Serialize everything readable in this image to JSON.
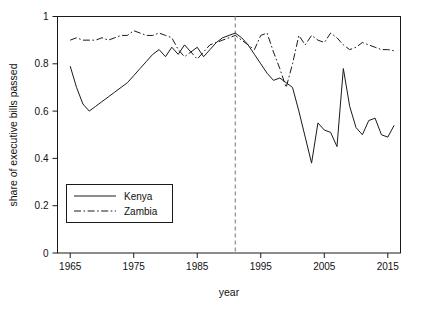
{
  "chart_data": {
    "type": "line",
    "title": "",
    "xlabel": "year",
    "ylabel": "share of executive bills passed",
    "xlim": [
      1963,
      2017
    ],
    "ylim": [
      0,
      1
    ],
    "xticks": [
      1965,
      1975,
      1985,
      1995,
      2005,
      2015
    ],
    "xticklabels": [
      "1965",
      "1975",
      "1985",
      "1995",
      "2005",
      "2015"
    ],
    "yticks": [
      0,
      0.2,
      0.4,
      0.6,
      0.8,
      1
    ],
    "yticklabels": [
      "0",
      "0.2",
      "0.4",
      "0.6",
      "0.8",
      "1"
    ],
    "grid": false,
    "legend_position": "lower-left",
    "annotations": [
      {
        "type": "vline",
        "x": 1991,
        "style": "dashed",
        "color": "#9a9a9a",
        "label": ""
      }
    ],
    "series": [
      {
        "name": "Kenya",
        "style": "solid",
        "color": "#1a1a1a",
        "x": [
          1965,
          1966,
          1967,
          1968,
          1969,
          1970,
          1971,
          1972,
          1973,
          1974,
          1975,
          1976,
          1977,
          1978,
          1979,
          1980,
          1981,
          1982,
          1983,
          1984,
          1985,
          1986,
          1987,
          1988,
          1989,
          1990,
          1991,
          1992,
          1993,
          1994,
          1995,
          1996,
          1997,
          1998,
          1999,
          2000,
          2001,
          2002,
          2003,
          2004,
          2005,
          2006,
          2007,
          2008,
          2009,
          2010,
          2011,
          2012,
          2013,
          2014,
          2015,
          2016
        ],
        "values": [
          0.79,
          0.7,
          0.63,
          0.6,
          0.62,
          0.64,
          0.66,
          0.68,
          0.7,
          0.72,
          0.75,
          0.78,
          0.81,
          0.84,
          0.86,
          0.83,
          0.87,
          0.84,
          0.88,
          0.85,
          0.87,
          0.83,
          0.86,
          0.89,
          0.91,
          0.92,
          0.93,
          0.91,
          0.88,
          0.84,
          0.8,
          0.76,
          0.73,
          0.74,
          0.72,
          0.7,
          0.6,
          0.49,
          0.38,
          0.55,
          0.52,
          0.51,
          0.45,
          0.78,
          0.62,
          0.53,
          0.5,
          0.56,
          0.57,
          0.5,
          0.49,
          0.54
        ]
      },
      {
        "name": "Zambia",
        "style": "dash-dot",
        "color": "#1a1a1a",
        "x": [
          1965,
          1966,
          1967,
          1968,
          1969,
          1970,
          1971,
          1972,
          1973,
          1974,
          1975,
          1976,
          1977,
          1978,
          1979,
          1980,
          1981,
          1982,
          1983,
          1984,
          1985,
          1986,
          1987,
          1988,
          1989,
          1990,
          1991,
          1992,
          1993,
          1994,
          1995,
          1996,
          1997,
          1998,
          1999,
          2000,
          2001,
          2002,
          2003,
          2004,
          2005,
          2006,
          2007,
          2008,
          2009,
          2010,
          2011,
          2012,
          2013,
          2014,
          2015,
          2016
        ],
        "values": [
          0.9,
          0.91,
          0.9,
          0.9,
          0.9,
          0.91,
          0.9,
          0.91,
          0.92,
          0.92,
          0.94,
          0.93,
          0.92,
          0.92,
          0.93,
          0.92,
          0.91,
          0.86,
          0.83,
          0.85,
          0.82,
          0.85,
          0.88,
          0.89,
          0.9,
          0.91,
          0.92,
          0.9,
          0.88,
          0.86,
          0.92,
          0.93,
          0.85,
          0.78,
          0.7,
          0.8,
          0.92,
          0.88,
          0.92,
          0.9,
          0.89,
          0.93,
          0.91,
          0.88,
          0.86,
          0.87,
          0.89,
          0.88,
          0.87,
          0.86,
          0.86,
          0.855
        ]
      }
    ]
  },
  "legend": {
    "items": [
      {
        "label": "Kenya",
        "style": "solid"
      },
      {
        "label": "Zambia",
        "style": "dash-dot"
      }
    ]
  }
}
